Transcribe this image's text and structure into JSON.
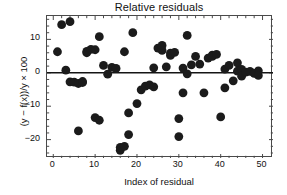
{
  "chart_data": {
    "type": "scatter",
    "title": "Relative residuals",
    "xlabel": "Index of residual",
    "ylabel": "(y − f(x))/y × 100",
    "xlim": [
      -1.5,
      52.5
    ],
    "ylim": [
      -25.5,
      17.0
    ],
    "xticks": [
      0,
      10,
      20,
      30,
      40,
      50
    ],
    "yticks": [
      10,
      0,
      -10,
      -20
    ],
    "xtick_labels": [
      "0",
      "10",
      "20",
      "30",
      "40",
      "50"
    ],
    "ytick_labels": [
      "10",
      "0",
      "−10",
      "−20"
    ],
    "grid": false,
    "legend": null,
    "marker": {
      "shape": "circle",
      "size": 4.4,
      "color": "#1b1b1b"
    },
    "reference_line": {
      "orientation": "horizontal",
      "y": 0,
      "color": "#151515",
      "width": 1.6
    },
    "x": [
      1,
      2,
      3,
      4,
      4,
      5,
      6,
      6,
      7,
      7,
      8,
      8,
      9,
      10,
      10,
      11,
      11,
      12,
      13,
      14,
      15,
      16,
      16,
      17,
      17,
      18,
      18,
      19,
      20,
      21,
      22,
      23,
      24,
      24,
      25,
      26,
      26,
      27,
      28,
      28,
      29,
      30,
      30,
      31,
      31,
      32,
      32,
      33,
      34,
      35,
      36,
      37,
      38,
      38,
      39,
      40,
      41,
      41,
      42,
      43,
      44,
      44,
      45,
      45,
      46,
      47,
      48,
      49,
      49
    ],
    "y": [
      6.3,
      14.4,
      0.8,
      15.3,
      -2.7,
      -2.8,
      -17.4,
      -3.2,
      -2.9,
      -2.6,
      6.0,
      6.4,
      7.0,
      6.9,
      -13.4,
      10.8,
      -14.2,
      2.2,
      -0.4,
      1.6,
      1.3,
      -23.2,
      -22.3,
      -22.0,
      6.3,
      -18.5,
      -12.0,
      12.0,
      -9.2,
      -5.1,
      -4.0,
      -3.6,
      -4.2,
      1.5,
      7.4,
      6.7,
      8.2,
      1.8,
      5.2,
      5.9,
      6.1,
      -13.7,
      -19.1,
      1.4,
      -6.0,
      -0.3,
      11.2,
      2.4,
      4.9,
      2.6,
      -6.0,
      4.4,
      5.3,
      4.9,
      5.5,
      -13.2,
      1.1,
      -4.5,
      2.2,
      -2.4,
      3.0,
      0.5,
      1.0,
      -1.0,
      0.2,
      0.4,
      -0.2,
      0.6,
      -0.8
    ]
  }
}
